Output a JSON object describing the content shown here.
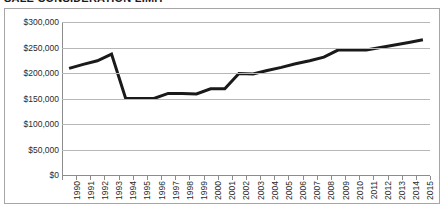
{
  "chart_data": {
    "type": "line",
    "title": "SALE CONSIDERATION LIMIT",
    "xlabel": "",
    "ylabel": "",
    "ylim": [
      0,
      300000
    ],
    "ytick_values": [
      0,
      50000,
      100000,
      150000,
      200000,
      250000,
      300000
    ],
    "ytick_labels": [
      "$0",
      "$50,000",
      "$100,000",
      "$150,000",
      "$200,000",
      "$250,000",
      "$300,000"
    ],
    "grid": true,
    "legend": false,
    "line_color": "#1a1a1a",
    "line_width": 3,
    "categories": [
      "1990",
      "1991",
      "1992",
      "1993",
      "1994",
      "1995",
      "1996",
      "1997",
      "1998",
      "1999",
      "2000",
      "2001",
      "2002",
      "2003",
      "2004",
      "2005",
      "2006",
      "2007",
      "2008",
      "2009",
      "2010",
      "2011",
      "2012",
      "2013",
      "2014",
      "2015"
    ],
    "values": [
      209000,
      217000,
      224000,
      237000,
      150000,
      150000,
      150000,
      160000,
      160000,
      159000,
      169000,
      169000,
      199000,
      198000,
      205000,
      211000,
      218000,
      224000,
      231000,
      245000,
      245000,
      245000,
      250000,
      255000,
      260000,
      265000
    ]
  }
}
